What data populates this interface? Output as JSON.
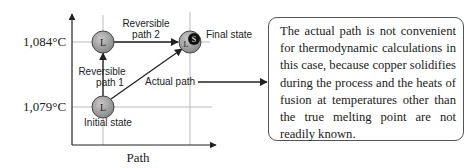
{
  "diagram": {
    "axes": {
      "x_label": "Path",
      "y_ticks": [
        "1,084°C",
        "1,079°C"
      ]
    },
    "nodes": {
      "initial": {
        "symbol": "L",
        "label": "Initial state"
      },
      "intermediate": {
        "symbol": "L",
        "label": ""
      },
      "final": {
        "symbol": "L",
        "symbol2": "S",
        "label": "Final state"
      }
    },
    "edges": {
      "reversible_path_1": {
        "line1": "Reversible",
        "line2": "path 1"
      },
      "reversible_path_2": {
        "line1": "Reversible",
        "line2": "path 2"
      },
      "actual_path": {
        "label": "Actual path"
      }
    },
    "callout": {
      "text": "The actual path is not convenient for thermodynamic calculations in this case, because copper solidifies during the process and the heats of fusion at temperatures other than the true melting point are not readily known."
    },
    "colors": {
      "node_fill": "#9a9a9a",
      "solid_fill": "#111111",
      "line": "#222222",
      "grid": "#bbbbbb"
    }
  }
}
